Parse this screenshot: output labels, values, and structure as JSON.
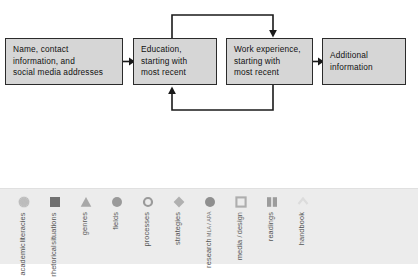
{
  "flowchart": {
    "title": "Resume organization flowchart",
    "boxes": [
      {
        "id": "name",
        "lines": [
          "Name, contact",
          "information, and",
          "social media addresses"
        ]
      },
      {
        "id": "education",
        "lines": [
          "Education,",
          "starting with",
          "most recent"
        ]
      },
      {
        "id": "work",
        "lines": [
          "Work experience,",
          "starting with",
          "most recent"
        ]
      },
      {
        "id": "additional",
        "lines": [
          "Additional",
          "information"
        ]
      }
    ],
    "connectors": [
      {
        "id": "name-to-education",
        "type": "arrow-right"
      },
      {
        "id": "work-to-additional",
        "type": "arrow-right"
      },
      {
        "id": "education-to-work-top-loop",
        "type": "loop-arrow-down"
      },
      {
        "id": "work-to-education-bottom-loop",
        "type": "loop-arrow-up"
      }
    ],
    "colors": {
      "box_fill": "#d6d6d6",
      "box_border": "#2b2b2b",
      "connector": "#1a1a1a"
    }
  },
  "legend": {
    "background": "#ececec",
    "items": [
      {
        "icon": "asterisk-icon",
        "shape": "asterisk",
        "color": "#bdbdbd",
        "lines": [
          "academic",
          "literacies"
        ],
        "sub": ""
      },
      {
        "icon": "filled-square-icon",
        "shape": "square-filled",
        "color": "#707070",
        "lines": [
          "rhetorical",
          "situations"
        ],
        "sub": ""
      },
      {
        "icon": "triangle-icon",
        "shape": "triangle-filled",
        "color": "#a8a8a8",
        "lines": [
          "genres"
        ],
        "sub": ""
      },
      {
        "icon": "filled-circle-icon",
        "shape": "circle-filled",
        "color": "#9a9a9a",
        "lines": [
          "fields"
        ],
        "sub": ""
      },
      {
        "icon": "hollow-circle-icon",
        "shape": "circle-hollow",
        "color": "#9a9a9a",
        "lines": [
          "processes"
        ],
        "sub": ""
      },
      {
        "icon": "diamond-icon",
        "shape": "diamond-filled",
        "color": "#b0b0b0",
        "lines": [
          "strategies"
        ],
        "sub": ""
      },
      {
        "icon": "filled-circle-icon",
        "shape": "circle-filled",
        "color": "#8f8f8f",
        "lines": [
          "research"
        ],
        "sub": "MLA / APA"
      },
      {
        "icon": "hollow-square-icon",
        "shape": "square-hollow",
        "color": "#aeaeae",
        "lines": [
          "media /",
          "design"
        ],
        "sub": ""
      },
      {
        "icon": "book-icon",
        "shape": "book",
        "color": "#9c9c9c",
        "lines": [
          "readings"
        ],
        "sub": ""
      },
      {
        "icon": "chevron-icon",
        "shape": "chevron",
        "color": "#dcdcdc",
        "lines": [
          "handbook"
        ],
        "sub": ""
      }
    ]
  }
}
